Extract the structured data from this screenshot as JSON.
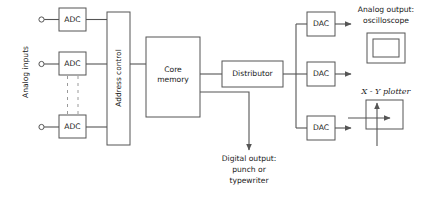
{
  "diagram": {
    "colors": {
      "line": "#555555",
      "dashed_line": "#9a9a9a",
      "text": "#1a1a1a",
      "background": "#ffffff"
    },
    "blocks": {
      "adc_top": "ADC",
      "adc_middle": "ADC",
      "adc_bottom": "ADC",
      "address_control": "Address control",
      "core_memory_line1": "Core",
      "core_memory_line2": "memory",
      "distributor": "Distributor",
      "dac_top": "DAC",
      "dac_middle": "DAC",
      "dac_bottom": "DAC"
    },
    "labels": {
      "analog_inputs": "Analog inputs",
      "analog_output_line1": "Analog output:",
      "analog_output_line2": "oscilloscope",
      "xy_plotter": "X - Y plotter",
      "digital_output_line1": "Digital output:",
      "digital_output_line2": "punch or",
      "digital_output_line3": "typewriter"
    }
  }
}
